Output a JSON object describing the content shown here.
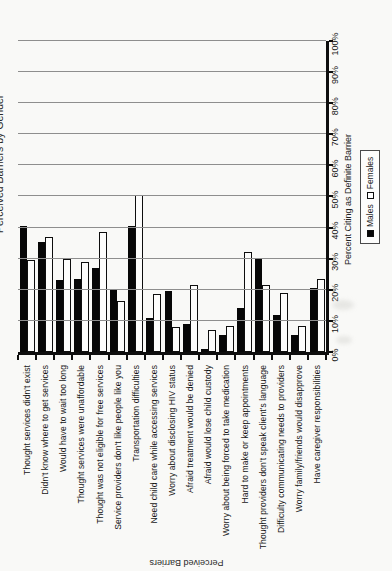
{
  "page": {
    "kind": "scanned report page with chart rotated 90 degrees counterclockwise",
    "background": "#f9f9f7"
  },
  "chart_data": {
    "type": "bar",
    "orientation": "horizontal bars (page printed landscape, scanned in portrait)",
    "title_fragment": "Perceived Barriers by Gender",
    "categories": [
      "Thought services didn't exist",
      "Didn't know where to get services",
      "Would have to wait too long",
      "Thought services were unaffordable",
      "Thought was not eligible for free services",
      "Service providers don't like people like you",
      "Transportation difficulties",
      "Need child care while accessing services",
      "Worry about disclosing HIV status",
      "Afraid treatment would be denied",
      "Afraid would lose child custody",
      "Worry about being forced to take medication",
      "Hard to make or keep appointments",
      "Thought providers don't speak client's language",
      "Difficulty communicating needs to providers",
      "Worry family/friends would disapprove",
      "Have caregiver responsibilities"
    ],
    "series": [
      {
        "name": "Males",
        "color": "#070707",
        "values": [
          40.5,
          35.5,
          23,
          23.5,
          27,
          20,
          40.5,
          11,
          19.5,
          9,
          1,
          5.5,
          14,
          30,
          12,
          5.5,
          20.5
        ]
      },
      {
        "name": "Females",
        "color": "#ffffff",
        "values": [
          29.5,
          37,
          30,
          29,
          38.5,
          16.5,
          50.5,
          18.5,
          8,
          21.5,
          7,
          8.5,
          32,
          21.5,
          19,
          8.5,
          23.5
        ]
      }
    ],
    "value_axis": {
      "label": "Percent Citing as Definite Barrier",
      "min": 0,
      "max": 100,
      "tick_step": 10,
      "tick_labels": [
        "0%",
        "10%",
        "20%",
        "30%",
        "40%",
        "50%",
        "60%",
        "70%",
        "80%",
        "90%",
        "100%"
      ]
    },
    "category_axis": {
      "label": "Perceived Barriers"
    },
    "legend": {
      "position": "below value axis",
      "items": [
        "Males",
        "Females"
      ]
    },
    "grid": true,
    "bar_style": {
      "males_fill": "#070707",
      "females_fill": "#ffffff",
      "outline": "#0e0e0e"
    }
  }
}
